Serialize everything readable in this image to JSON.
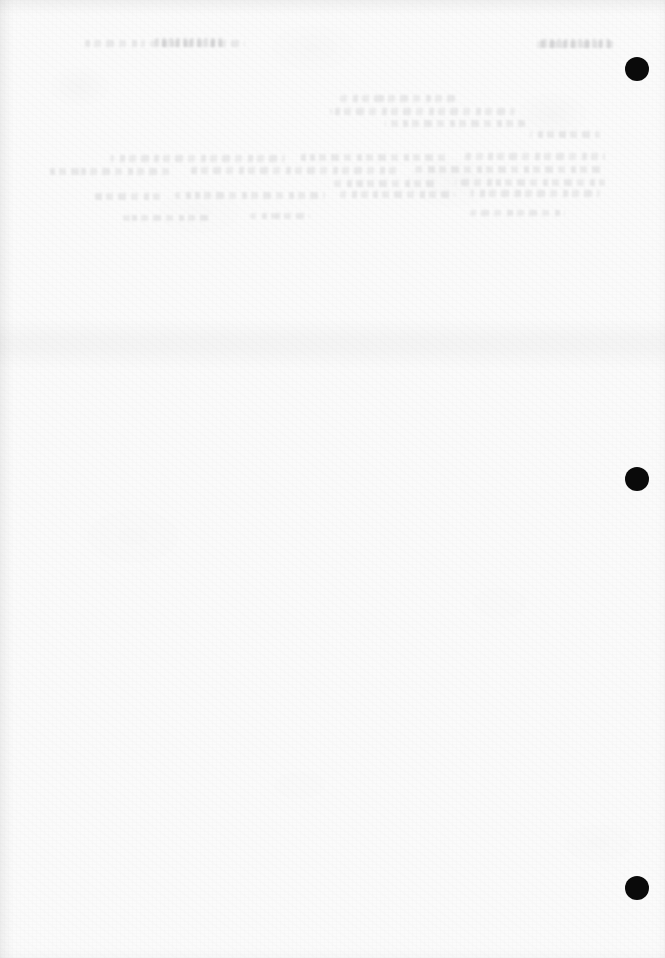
{
  "document": {
    "kind": "scanned-page",
    "page_state": "blank-verso",
    "visible_text": "",
    "width_px": 665,
    "height_px": 958
  },
  "colors": {
    "paper": "#fbfbfb",
    "page_background": "#ffffff",
    "punch_hole": "#0a0a0a",
    "ghost_text": "#2e2e34"
  },
  "punch_holes": {
    "count": 3,
    "diameter_px": 24,
    "center_x_px": 637,
    "items": [
      {
        "name": "punch-hole-top",
        "cx": 637,
        "cy": 69,
        "d": 24
      },
      {
        "name": "punch-hole-middle",
        "cx": 637,
        "cy": 479,
        "d": 24
      },
      {
        "name": "punch-hole-bottom",
        "cx": 637,
        "cy": 888,
        "d": 24
      }
    ]
  },
  "artifacts": {
    "fold_band": {
      "top": 318,
      "height": 52
    },
    "edge_shading": [
      "left",
      "top",
      "right",
      "bottom"
    ],
    "bleed_through_note": "Faint mirrored show-through from the reverse side; characters are not legible."
  },
  "ghost_lines": [
    {
      "x": 85,
      "y": 40,
      "w": 60,
      "h": 7
    },
    {
      "x": 150,
      "y": 40,
      "w": 95,
      "h": 7
    },
    {
      "x": 535,
      "y": 41,
      "w": 80,
      "h": 7
    },
    {
      "x": 340,
      "y": 95,
      "w": 120,
      "h": 7
    },
    {
      "x": 330,
      "y": 108,
      "w": 185,
      "h": 7
    },
    {
      "x": 385,
      "y": 120,
      "w": 140,
      "h": 7
    },
    {
      "x": 530,
      "y": 131,
      "w": 70,
      "h": 7
    },
    {
      "x": 110,
      "y": 155,
      "w": 175,
      "h": 7
    },
    {
      "x": 300,
      "y": 154,
      "w": 150,
      "h": 7
    },
    {
      "x": 465,
      "y": 153,
      "w": 140,
      "h": 7
    },
    {
      "x": 45,
      "y": 168,
      "w": 125,
      "h": 7
    },
    {
      "x": 190,
      "y": 167,
      "w": 210,
      "h": 7
    },
    {
      "x": 415,
      "y": 166,
      "w": 190,
      "h": 7
    },
    {
      "x": 330,
      "y": 180,
      "w": 105,
      "h": 7
    },
    {
      "x": 455,
      "y": 179,
      "w": 150,
      "h": 7
    },
    {
      "x": 90,
      "y": 193,
      "w": 70,
      "h": 7
    },
    {
      "x": 175,
      "y": 192,
      "w": 150,
      "h": 7
    },
    {
      "x": 340,
      "y": 191,
      "w": 115,
      "h": 7
    },
    {
      "x": 470,
      "y": 190,
      "w": 130,
      "h": 7
    },
    {
      "x": 120,
      "y": 215,
      "w": 90,
      "h": 6
    },
    {
      "x": 250,
      "y": 213,
      "w": 60,
      "h": 6
    },
    {
      "x": 470,
      "y": 210,
      "w": 95,
      "h": 6
    }
  ],
  "ghost_words": [
    {
      "x": 155,
      "y": 38,
      "w": 70,
      "h": 9
    },
    {
      "x": 540,
      "y": 39,
      "w": 72,
      "h": 9
    }
  ]
}
